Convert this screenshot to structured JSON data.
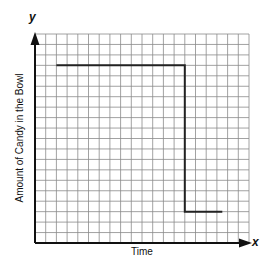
{
  "chart_data": {
    "type": "line",
    "title": "",
    "xlabel": "Time",
    "ylabel": "Amount of Candy in the Bowl",
    "x_axis_name": "x",
    "y_axis_name": "y",
    "grid": true,
    "grid_cells": {
      "columns": 20,
      "rows": 20
    },
    "xlim": [
      0,
      20
    ],
    "ylim": [
      0,
      20
    ],
    "tick_labels": {
      "x": [],
      "y": []
    },
    "legend": null,
    "series": [
      {
        "name": "Amount of Candy",
        "x": [
          2,
          14,
          14,
          17.5
        ],
        "y": [
          17,
          17,
          3,
          3
        ]
      }
    ],
    "colors": {
      "grid": "#8a8a8a",
      "axes": "#111111",
      "line": "#222222"
    }
  }
}
